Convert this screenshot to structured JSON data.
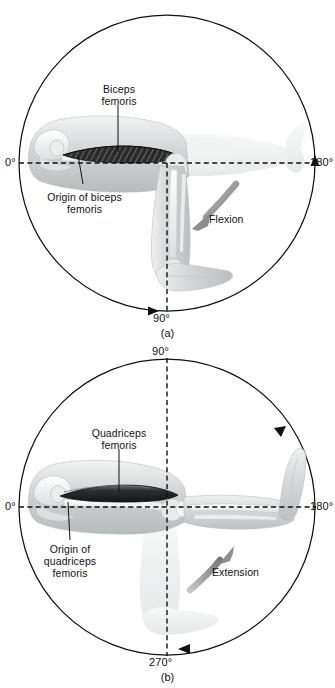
{
  "figure": {
    "colors": {
      "outline": "#111111",
      "dashed_axis": "#111111",
      "motion_arrow": "#8c8c8c",
      "muscle_dark": "#2b2b2b",
      "limb_fill": "#c9cbcc",
      "ghost_limb": "#e6e7e8",
      "background": "#ffffff"
    }
  },
  "panels": [
    {
      "id": "a",
      "caption": "(a)",
      "degree_labels": {
        "left": "0°",
        "right": "180°",
        "bottom": "90°"
      },
      "motion": {
        "label": "Flexion",
        "direction": "down-left"
      },
      "annotations": [
        {
          "name": "biceps-femoris",
          "text": "Biceps\nfemoris",
          "lines": [
            "Biceps",
            "femoris"
          ]
        },
        {
          "name": "origin-of-biceps-femoris",
          "text": "Origin of biceps\nfemoris",
          "lines": [
            "Origin of biceps",
            "femoris"
          ]
        }
      ]
    },
    {
      "id": "b",
      "caption": "(b)",
      "degree_labels": {
        "left": "0°",
        "right": "180°",
        "top": "90°",
        "bottom": "270°"
      },
      "motion": {
        "label": "Extension",
        "direction": "up-right"
      },
      "annotations": [
        {
          "name": "quadriceps-femoris",
          "text": "Quadriceps\nfemoris",
          "lines": [
            "Quadriceps",
            "femoris"
          ]
        },
        {
          "name": "origin-of-quadriceps-femoris",
          "text": "Origin of\nquadriceps\nfemoris",
          "lines": [
            "Origin of",
            "quadriceps",
            "femoris"
          ]
        }
      ]
    }
  ],
  "panel_a": {
    "deg_left": "0°",
    "deg_right": "180°",
    "deg_bottom": "90°",
    "motion_label": "Flexion",
    "muscle_line1": "Biceps",
    "muscle_line2": "femoris",
    "origin_line1": "Origin of biceps",
    "origin_line2": "femoris",
    "caption": "(a)"
  },
  "panel_b": {
    "deg_left": "0°",
    "deg_right": "180°",
    "deg_top": "90°",
    "deg_bottom": "270°",
    "motion_label": "Extension",
    "muscle_line1": "Quadriceps",
    "muscle_line2": "femoris",
    "origin_line1": "Origin of",
    "origin_line2": "quadriceps",
    "origin_line3": "femoris",
    "caption": "(b)"
  }
}
